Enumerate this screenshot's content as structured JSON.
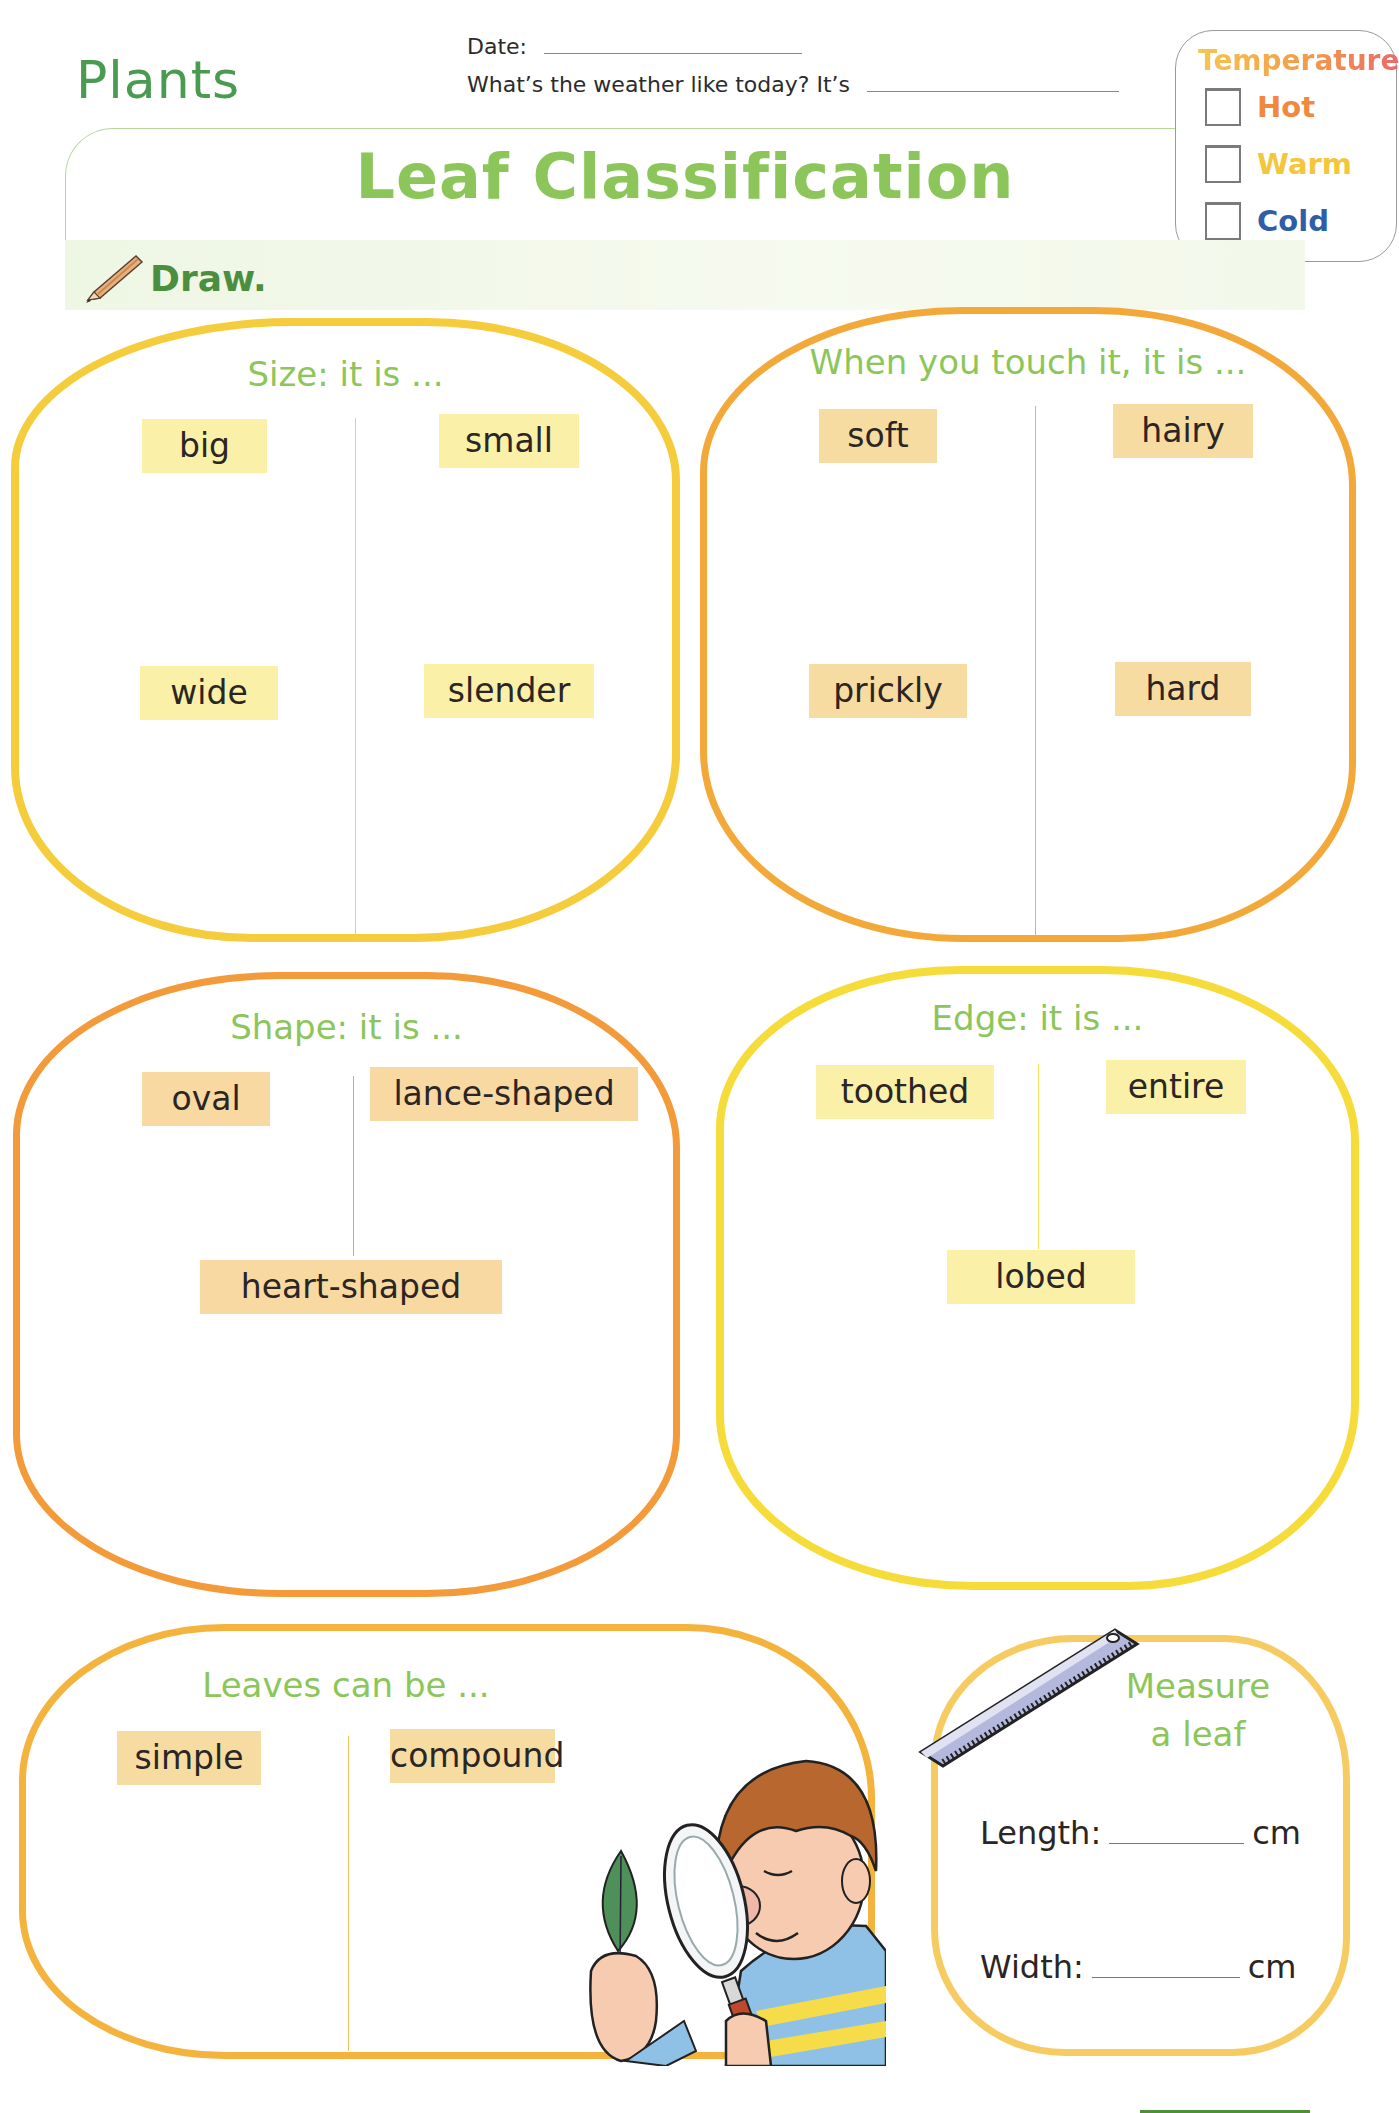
{
  "header": {
    "unit_title": "Plants",
    "date_label": "Date:",
    "weather_question": "What’s the weather like today? It’s",
    "main_title": "Leaf Classification"
  },
  "temperature": {
    "title": "Temperature",
    "options": [
      {
        "label": "Hot",
        "color": "#f0883e",
        "checked": false
      },
      {
        "label": "Warm",
        "color": "#f4c63c",
        "checked": false
      },
      {
        "label": "Cold",
        "color": "#2f5ea8",
        "checked": false
      }
    ]
  },
  "instruction": {
    "label": "Draw."
  },
  "sections": {
    "size": {
      "title": "Size: it is ...",
      "tags": [
        "big",
        "small",
        "wide",
        "slender"
      ],
      "border_color": "#f5cc3c"
    },
    "touch": {
      "title": "When you touch it, it is ...",
      "tags": [
        "soft",
        "hairy",
        "prickly",
        "hard"
      ],
      "border_color": "#f3a93a"
    },
    "shape": {
      "title": "Shape: it is ...",
      "tags": [
        "oval",
        "lance-shaped",
        "heart-shaped"
      ],
      "border_color": "#f39a3a"
    },
    "edge": {
      "title": "Edge: it is ...",
      "tags": [
        "toothed",
        "entire",
        "lobed"
      ],
      "border_color": "#f6dc3a"
    },
    "leaves": {
      "title": "Leaves can be ...",
      "tags": [
        "simple",
        "compound"
      ],
      "border_color": "#f3b33c"
    },
    "measure": {
      "title_line1": "Measure",
      "title_line2": "a leaf",
      "length_label": "Length:",
      "width_label": "Width:",
      "unit": "cm",
      "border_color": "#f6cc62"
    }
  },
  "colors": {
    "title_green": "#8cc65a",
    "unit_green": "#4a9a52",
    "tag_yellow": "#faf0a8",
    "tag_orange": "#f7dca2"
  }
}
